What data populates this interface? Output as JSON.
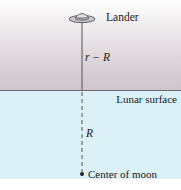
{
  "diagram": {
    "labels": {
      "lander": "Lander",
      "altitude": "r − R",
      "surface": "Lunar surface",
      "radius": "R",
      "center": "Center of moon"
    },
    "colors": {
      "sky_top": "#ffffff",
      "sky_bottom": "#cdc5ca",
      "moon_fill": "#dcf0f8",
      "line": "#555555",
      "surface_line": "#6f6a6e"
    }
  }
}
